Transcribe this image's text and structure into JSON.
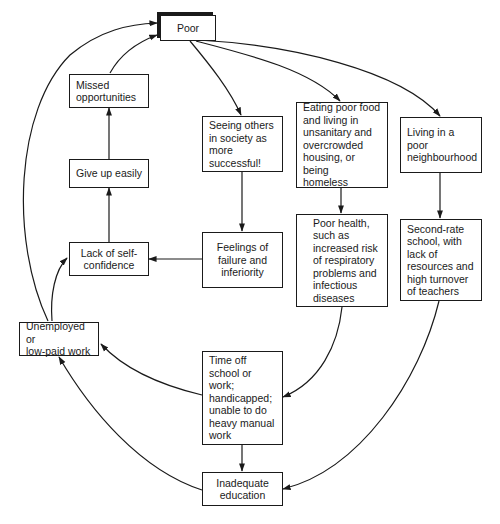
{
  "diagram": {
    "type": "cycle-of-poverty flow diagram",
    "nodes": {
      "poor": {
        "label": "Poor"
      },
      "missed": {
        "label": "Missed\nopportunities"
      },
      "give_up": {
        "label": "Give up easily"
      },
      "lack_conf": {
        "label": "Lack of self-\nconfidence"
      },
      "unemployed": {
        "label": "Unemployed or\nlow-paid work"
      },
      "seeing": {
        "label": "Seeing others\nin society as\nmore\nsuccessful!"
      },
      "feelings": {
        "label": "Feelings of\nfailure and\ninferiority"
      },
      "eating": {
        "label": "Eating poor food\nand living in\nunsanitary and\novercrowded\nhousing, or being\nhomeless"
      },
      "health": {
        "label": "Poor health,\nsuch as\nincreased risk\nof respiratory\nproblems and\ninfectious\ndiseases"
      },
      "living": {
        "label": "Living in a\npoor\nneighbourhood"
      },
      "second": {
        "label": "Second-rate\nschool, with\nlack of\nresources and\nhigh turnover\nof teachers"
      },
      "time_off": {
        "label": "Time off\nschool or\nwork;\nhandicapped;\nunable to do\nheavy manual\nwork"
      },
      "inadequate": {
        "label": "Inadequate\neducation"
      }
    },
    "edges": [
      {
        "from": "Poor",
        "to": "Seeing others in society as more successful!"
      },
      {
        "from": "Poor",
        "to": "Eating poor food and living in unsanitary and overcrowded housing, or being homeless"
      },
      {
        "from": "Poor",
        "to": "Living in a poor neighbourhood"
      },
      {
        "from": "Seeing others in society as more successful!",
        "to": "Feelings of failure and inferiority"
      },
      {
        "from": "Feelings of failure and inferiority",
        "to": "Lack of self-confidence"
      },
      {
        "from": "Lack of self-confidence",
        "to": "Give up easily"
      },
      {
        "from": "Give up easily",
        "to": "Missed opportunities"
      },
      {
        "from": "Missed opportunities",
        "to": "Poor"
      },
      {
        "from": "Eating poor food and living in unsanitary and overcrowded housing, or being homeless",
        "to": "Poor health"
      },
      {
        "from": "Poor health",
        "to": "Time off school or work; handicapped; unable to do heavy manual work"
      },
      {
        "from": "Time off school or work",
        "to": "Inadequate education"
      },
      {
        "from": "Time off school or work",
        "to": "Unemployed or low-paid work"
      },
      {
        "from": "Living in a poor neighbourhood",
        "to": "Second-rate school"
      },
      {
        "from": "Second-rate school",
        "to": "Inadequate education"
      },
      {
        "from": "Inadequate education",
        "to": "Unemployed or low-paid work"
      },
      {
        "from": "Unemployed or low-paid work",
        "to": "Lack of self-confidence"
      },
      {
        "from": "Unemployed or low-paid work",
        "to": "Poor"
      }
    ],
    "colors": {
      "stroke": "#1a1a1a",
      "background": "#ffffff"
    }
  }
}
